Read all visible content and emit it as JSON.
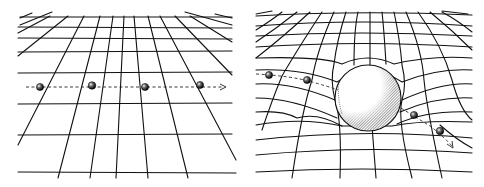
{
  "figure": {
    "panels": [
      {
        "id": "flat",
        "description": "Flat spacetime grid in perspective; a small ball travels in a straight dashed line",
        "ball_positions": [
          [
            40,
            87
          ],
          [
            92,
            85
          ],
          [
            145,
            87
          ],
          [
            200,
            85
          ]
        ],
        "arrow_end": [
          225,
          87
        ]
      },
      {
        "id": "curved",
        "description": "Grid warped by a massive sphere; ball's path bends around the sphere",
        "sphere": {
          "cx": 126,
          "cy": 98,
          "r": 33
        },
        "ball_positions": [
          [
            27,
            75
          ],
          [
            65,
            80
          ],
          [
            172,
            115
          ],
          [
            198,
            131
          ]
        ],
        "arrow_end": [
          212,
          148
        ]
      }
    ],
    "colors": {
      "ink": "#111111",
      "background": "#ffffff",
      "ball": "#1a1a1a"
    }
  }
}
